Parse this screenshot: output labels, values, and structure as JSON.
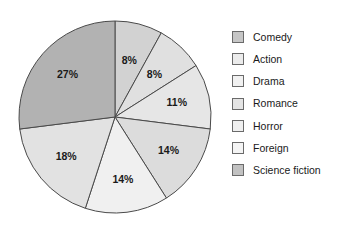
{
  "chart_data": {
    "type": "pie",
    "title": "",
    "xlabel": "",
    "ylabel": "",
    "legend_position": "right",
    "grid": false,
    "unit": "%",
    "start_angle_deg": 0,
    "direction": "clockwise",
    "categories": [
      "Comedy",
      "Action",
      "Drama",
      "Romance",
      "Horror",
      "Foreign",
      "Science fiction"
    ],
    "values": [
      8,
      8,
      11,
      14,
      14,
      18,
      27
    ],
    "labels": [
      "8%",
      "8%",
      "11%",
      "14%",
      "14%",
      "18%",
      "27%"
    ],
    "colors": [
      "#d2d2d2",
      "#e0e0e0",
      "#e6e6e6",
      "#dcdcdc",
      "#f0f0f0",
      "#e2e2e2",
      "#b2b2b2"
    ],
    "slices": [
      {
        "label": "Comedy",
        "value": 8,
        "text": "8%",
        "color": "#d2d2d2"
      },
      {
        "label": "Action",
        "value": 8,
        "text": "8%",
        "color": "#e0e0e0"
      },
      {
        "label": "Drama",
        "value": 11,
        "text": "11%",
        "color": "#e6e6e6"
      },
      {
        "label": "Romance",
        "value": 14,
        "text": "14%",
        "color": "#dcdcdc"
      },
      {
        "label": "Horror",
        "value": 14,
        "text": "14%",
        "color": "#f0f0f0"
      },
      {
        "label": "Foreign",
        "value": 18,
        "text": "18%",
        "color": "#e2e2e2"
      },
      {
        "label": "Science fiction",
        "value": 27,
        "text": "27%",
        "color": "#b2b2b2"
      }
    ]
  },
  "legend": {
    "items": [
      {
        "label": "Comedy",
        "color": "#c6c6c6"
      },
      {
        "label": "Action",
        "color": "#ebebeb"
      },
      {
        "label": "Drama",
        "color": "#f1f1f1"
      },
      {
        "label": "Romance",
        "color": "#e4e4e4"
      },
      {
        "label": "Horror",
        "color": "#efefef"
      },
      {
        "label": "Foreign",
        "color": "#f4f4f4"
      },
      {
        "label": "Science fiction",
        "color": "#c2c2c2"
      }
    ]
  },
  "geometry": {
    "cx": 115,
    "cy": 117,
    "r": 96,
    "stroke": "#4a4a4a"
  }
}
